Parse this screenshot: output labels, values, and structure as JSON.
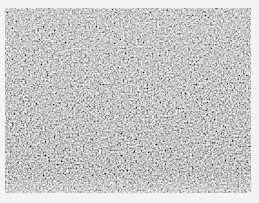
{
  "image": {
    "description": "grayscale granular noise texture",
    "background_color": "#f3f3f3",
    "texture_base_color": "#8a8a8a",
    "texture_region": {
      "x": 5,
      "y": 8,
      "width": 246,
      "height": 185
    }
  }
}
